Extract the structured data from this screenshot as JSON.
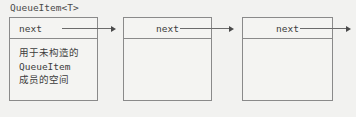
{
  "diagram": {
    "title": "QueueItem<T>",
    "background_color": "#f2f2f0",
    "line_color": "#8a8a8a",
    "arrow_color": "#6b6b6b",
    "text_color": "#3c3c3c",
    "nodes": [
      {
        "id": "node-1",
        "header_label": "next",
        "header_align": "left",
        "body_lines": [
          "用于未构造的",
          "QueueItem",
          "成员的空间"
        ]
      },
      {
        "id": "node-2",
        "header_label": "next",
        "header_align": "center",
        "body_lines": []
      },
      {
        "id": "node-3",
        "header_label": "next",
        "header_align": "center",
        "body_lines": []
      }
    ],
    "arrows": [
      {
        "id": "arrow-1",
        "from": "node-1",
        "to": "node-2"
      },
      {
        "id": "arrow-2",
        "from": "node-2",
        "to": "node-3"
      },
      {
        "id": "arrow-3",
        "from": "node-3",
        "to": ""
      }
    ]
  }
}
